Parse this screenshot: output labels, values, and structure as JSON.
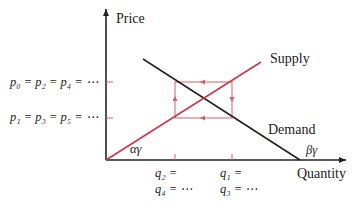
{
  "axes": {
    "y_label": "Price",
    "x_label": "Quantity"
  },
  "curves": {
    "supply_label": "Supply",
    "demand_label": "Demand",
    "supply_intercept_label": "αγ",
    "demand_intercept_label": "βγ"
  },
  "price_levels": {
    "high": "p₀ = p₂ = p₄ = ⋯",
    "low": "p₁ = p₃ = p₅ = ⋯"
  },
  "quantity_levels": {
    "low_line1": "q₂ =",
    "low_line2": "q₄ = ⋯",
    "high_line1": "q₁ =",
    "high_line2": "q₃ = ⋯"
  },
  "colors": {
    "supply": "#c8384a",
    "cobweb": "#d0606e",
    "axes": "#222222",
    "demand": "#222222"
  }
}
